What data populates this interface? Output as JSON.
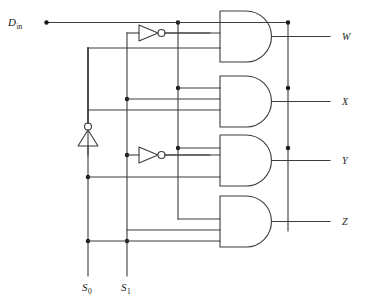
{
  "diagram": {
    "type": "logic-circuit-schematic",
    "colors": {
      "wire": "#3c3c3c",
      "node": "#1a1a1a",
      "background": "#ffffff",
      "text": "#1a1a1a"
    },
    "inputs": [
      {
        "id": "din",
        "label": "D",
        "subscript": "in",
        "x": 26,
        "y": 22
      },
      {
        "id": "s0",
        "label": "S",
        "subscript": "0",
        "x": 84,
        "y": 288
      },
      {
        "id": "s1",
        "label": "S",
        "subscript": "1",
        "x": 123,
        "y": 288
      }
    ],
    "outputs": [
      {
        "id": "w",
        "label": "W",
        "x": 342,
        "y": 40
      },
      {
        "id": "x",
        "label": "X",
        "x": 342,
        "y": 104
      },
      {
        "id": "y",
        "label": "Y",
        "x": 342,
        "y": 163
      },
      {
        "id": "z",
        "label": "Z",
        "x": 342,
        "y": 224
      }
    ],
    "gates": [
      {
        "id": "and-w",
        "type": "AND",
        "inputs": 3,
        "output": "W"
      },
      {
        "id": "and-x",
        "type": "AND",
        "inputs": 3,
        "output": "X"
      },
      {
        "id": "and-y",
        "type": "AND",
        "inputs": 3,
        "output": "Y"
      },
      {
        "id": "and-z",
        "type": "AND",
        "inputs": 3,
        "output": "Z"
      }
    ],
    "inverters": [
      {
        "id": "inv-s1-top",
        "type": "NOT",
        "orientation": "right",
        "drives": "S1-bar-upper"
      },
      {
        "id": "inv-s0",
        "type": "NOT",
        "orientation": "up",
        "drives": "S0-bar"
      },
      {
        "id": "inv-s1-lower",
        "type": "NOT",
        "orientation": "right",
        "drives": "S1-bar-lower"
      }
    ]
  }
}
